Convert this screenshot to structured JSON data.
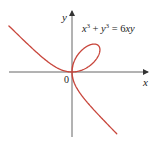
{
  "diagram": {
    "equation": {
      "term1_base": "x",
      "term1_exp": "3",
      "plus": " + ",
      "term2_base": "y",
      "term2_exp": "3",
      "equals": " = ",
      "rhs_coef": "6",
      "rhs_var1": "x",
      "rhs_var2": "y"
    },
    "axes": {
      "x_label": "x",
      "y_label": "y",
      "origin_label": "0"
    },
    "colors": {
      "curve": "#c8463c",
      "axis": "#555555",
      "text": "#222222"
    }
  },
  "chart_data": {
    "type": "line",
    "xlabel": "x",
    "ylabel": "y",
    "grid": false,
    "curve": "folium of Descartes x^3+y^3=6xy, loop in first quadrant with tip near (3,3), branches approaching asymptote x+y=-2"
  }
}
